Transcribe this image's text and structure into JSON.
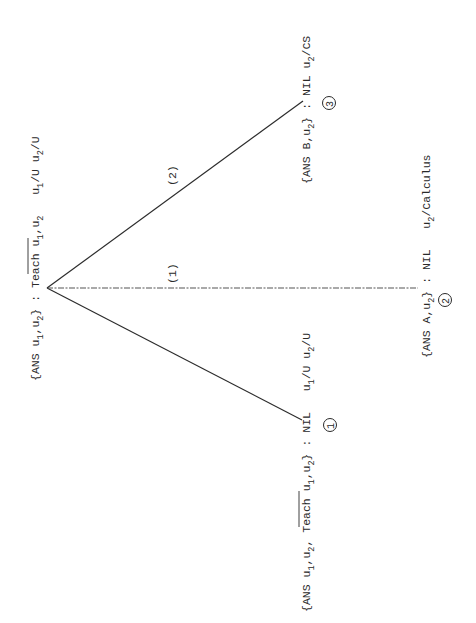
{
  "diagram": {
    "type": "search-tree",
    "orientation": "rotated-90-ccw",
    "root": {
      "id": "root",
      "label_parts": [
        {
          "t": "{ANS u"
        },
        {
          "s": "1"
        },
        {
          "t": ",u"
        },
        {
          "s": "2"
        },
        {
          "t": "} : "
        },
        {
          "t": "Teach",
          "overline": true
        },
        {
          "t": " u"
        },
        {
          "s": "1"
        },
        {
          "t": ",u"
        },
        {
          "s": "2"
        },
        {
          "t": "  u"
        },
        {
          "s": "1"
        },
        {
          "t": "/U u"
        },
        {
          "s": "2"
        },
        {
          "t": "/U"
        }
      ],
      "text": "{ANS u1,u2} : ¬Teach u1,u2  u1/U u2/U"
    },
    "nodes": [
      {
        "id": "node-1",
        "number": "1",
        "text": "{ANS u1,u2, ¬Teach u1,u2} : NIL  u1/U u2/U",
        "label_parts": [
          {
            "t": "{ANS u"
          },
          {
            "s": "1"
          },
          {
            "t": ",u"
          },
          {
            "s": "2"
          },
          {
            "t": ", "
          },
          {
            "t": "Teach",
            "overline": true
          },
          {
            "t": " u"
          },
          {
            "s": "1"
          },
          {
            "t": ",u"
          },
          {
            "s": "2"
          },
          {
            "t": "} : NIL  u"
          },
          {
            "s": "1"
          },
          {
            "t": "/U u"
          },
          {
            "s": "2"
          },
          {
            "t": "/U"
          }
        ]
      },
      {
        "id": "node-2",
        "number": "2",
        "text": "{ANS A,u2} : NIL  u2/Calculus",
        "label_parts": [
          {
            "t": "{ANS A,u"
          },
          {
            "s": "2"
          },
          {
            "t": "} : NIL  u"
          },
          {
            "s": "2"
          },
          {
            "t": "/Calculus"
          }
        ]
      },
      {
        "id": "node-3",
        "number": "3",
        "text": "{ANS B,u2} : NIL u2/CS",
        "label_parts": [
          {
            "t": "{ANS B,u"
          },
          {
            "s": "2"
          },
          {
            "t": "} : NIL u"
          },
          {
            "s": "2"
          },
          {
            "t": "/CS"
          }
        ]
      }
    ],
    "edges": [
      {
        "from": "root",
        "to": "node-1",
        "label": "",
        "style": "solid"
      },
      {
        "from": "root",
        "to": "node-2",
        "label": "(1)",
        "style": "dashed"
      },
      {
        "from": "root",
        "to": "node-3",
        "label": "(2)",
        "style": "solid"
      }
    ],
    "edge_labels": {
      "e1": "(1)",
      "e2": "(2)"
    },
    "node_numbers": {
      "n1": "1",
      "n2": "2",
      "n3": "3"
    },
    "colors": {
      "ink": "#2a2a2a",
      "background": "#ffffff"
    }
  }
}
